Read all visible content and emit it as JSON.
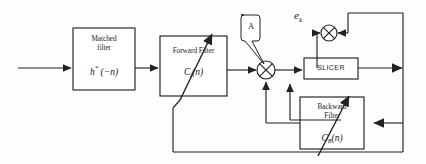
{
  "diagram": {
    "background": "#fdfdfd",
    "line_color": "#222222"
  },
  "blocks": {
    "matched_filter": {
      "line1": "Matched",
      "line2": "filter",
      "equation_main": "h",
      "equation_star": "*",
      "equation_arg": "(−n)",
      "x": 73,
      "y": 28,
      "w": 62,
      "h": 62
    },
    "forward_filter": {
      "title": "Forward Filter",
      "equation_main": "C",
      "equation_sub": "f",
      "equation_arg": "(n)",
      "x": 160,
      "y": 36,
      "w": 67,
      "h": 60,
      "adaptive": true
    },
    "slicer": {
      "label": "SLICER",
      "x": 304,
      "y": 58,
      "w": 54,
      "h": 21
    },
    "backward_filter": {
      "line1": "Backward",
      "line2": "Filter",
      "equation_main": "C",
      "equation_sub": "B",
      "equation_arg": "(n)",
      "x": 300,
      "y": 97,
      "w": 64,
      "h": 52,
      "adaptive": true
    }
  },
  "annotations": {
    "callout_a": {
      "label": "A",
      "x": 239,
      "y": 14,
      "w": 20,
      "h": 28
    },
    "error_signal": {
      "label": "e",
      "subscript": "k",
      "x": 296,
      "y": 6
    }
  },
  "nodes": {
    "summer_1": {
      "name": "summing-junction-1",
      "cx": 266,
      "cy": 70,
      "r": 9
    },
    "summer_2": {
      "name": "summing-junction-2",
      "cx": 329,
      "cy": 33,
      "r": 8
    }
  },
  "signals": {
    "input_arrow": "channel input",
    "feedback_note": "decision feedback"
  }
}
